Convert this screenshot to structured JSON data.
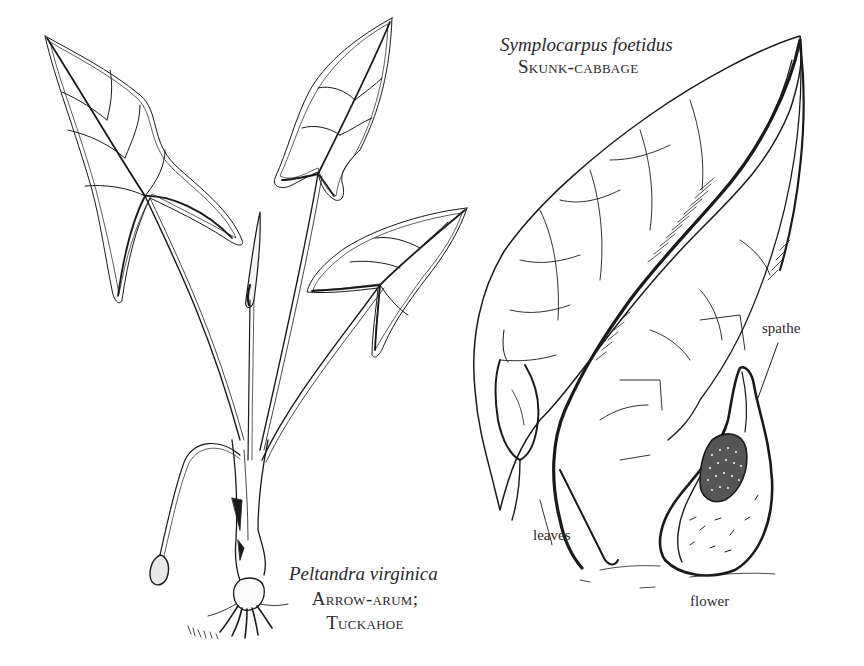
{
  "figure": {
    "type": "botanical line illustration",
    "background": "#ffffff",
    "ink_color": "#1a1a1a"
  },
  "plants": [
    {
      "id": "peltandra",
      "scientific_name": "Peltandra virginica",
      "common_name_line1": "Arrow-arum;",
      "common_name_line2": "Tuckahoe"
    },
    {
      "id": "symplocarpus",
      "scientific_name": "Symplocarpus foetidus",
      "common_name": "Skunk-cabbage",
      "part_labels": {
        "spathe": "spathe",
        "leaves": "leaves",
        "flower": "flower"
      }
    }
  ]
}
